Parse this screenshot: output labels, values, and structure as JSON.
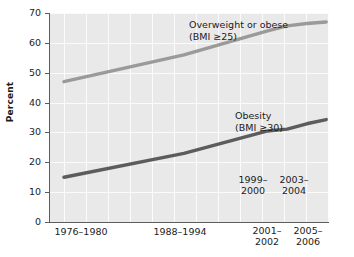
{
  "chart_data": {
    "type": "line",
    "title": "",
    "subtitle": "",
    "xlabel": "",
    "ylabel": "Percent",
    "ylim": [
      0,
      70
    ],
    "yticks": [
      0,
      10,
      20,
      30,
      40,
      50,
      60,
      70
    ],
    "ytick_labels": [
      "0",
      "10",
      "20",
      "30",
      "40",
      "50",
      "60",
      "70"
    ],
    "grid": true,
    "grid_color": "#fbfbfb",
    "plot_background": "#e9e9e9",
    "legend_position": "inline-annotation",
    "categories": [
      "1976-1980",
      "1988-1994",
      "1999-2000",
      "2001-2002",
      "2003-2004",
      "2005-2006"
    ],
    "x_positions_pct": [
      5,
      48,
      78,
      85,
      92,
      99
    ],
    "series": [
      {
        "name": "Overweight or obese (BMI ≥25)",
        "color": "#9a9a9a",
        "values": [
          47,
          56,
          64,
          65.7,
          66.5,
          67
        ]
      },
      {
        "name": "Obesity (BMI ≥30)",
        "color": "#5c5c5c",
        "values": [
          15,
          23,
          30.5,
          31.1,
          32.9,
          34.3
        ]
      }
    ],
    "annotations": [
      {
        "id": "overweight-annotation",
        "line1": "Overweight or obese",
        "line2": "(BMI ≥25)"
      },
      {
        "id": "obesity-annotation",
        "line1": "Obesity",
        "line2": "(BMI ≥30)"
      }
    ],
    "xtick_labels_below": [
      {
        "id": "xtick-1976-1980",
        "text": "1976–1980"
      },
      {
        "id": "xtick-1988-1994",
        "text": "1988–1994"
      },
      {
        "id": "xtick-2001-2002",
        "line1": "2001–",
        "line2": "2002"
      },
      {
        "id": "xtick-2005-2006",
        "line1": "2005–",
        "line2": "2006"
      }
    ],
    "xtick_labels_inside": [
      {
        "id": "xtick-1999-2000",
        "line1": "1999–",
        "line2": "2000"
      },
      {
        "id": "xtick-2003-2004",
        "line1": "2003–",
        "line2": "2004"
      }
    ]
  }
}
